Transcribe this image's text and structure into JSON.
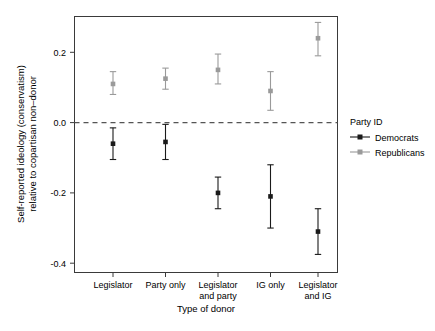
{
  "chart_data": {
    "type": "scatter",
    "title": "",
    "xlabel": "Type of donor",
    "ylabel": "Self-reported ideology (conservatism)\nrelative to copartisan non–donor",
    "ylabel_line1": "Self-reported ideology (conservatism)",
    "ylabel_line2": "relative to copartisan non–donor",
    "categories": [
      "Legislator",
      "Party only",
      "Legislator and party",
      "IG only",
      "Legislator and IG"
    ],
    "category_lines": [
      [
        "Legislator"
      ],
      [
        "Party only"
      ],
      [
        "Legislator",
        "and party"
      ],
      [
        "IG only"
      ],
      [
        "Legislator",
        "and IG"
      ]
    ],
    "ylim": [
      -0.45,
      0.31
    ],
    "yticks": [
      0.2,
      0.0,
      -0.2,
      -0.4
    ],
    "ytick_labels": [
      "0.2",
      "0.0",
      "-0.2",
      "-0.4"
    ],
    "grid": false,
    "reference_line": {
      "y": 0.0,
      "style": "dashed",
      "color": "#555555"
    },
    "legend": {
      "title": "Party ID",
      "position": "right",
      "entries": [
        {
          "label": "Democrats",
          "color": "#1a1a1a"
        },
        {
          "label": "Republicans",
          "color": "#9a9a9a"
        }
      ]
    },
    "series": [
      {
        "name": "Democrats",
        "color": "#1a1a1a",
        "values": [
          -0.06,
          -0.055,
          -0.2,
          -0.21,
          -0.31
        ],
        "ci_low": [
          -0.105,
          -0.105,
          -0.245,
          -0.3,
          -0.375
        ],
        "ci_high": [
          -0.015,
          -0.005,
          -0.155,
          -0.12,
          -0.245
        ]
      },
      {
        "name": "Republicans",
        "color": "#9a9a9a",
        "values": [
          0.11,
          0.125,
          0.15,
          0.09,
          0.24
        ],
        "ci_low": [
          0.08,
          0.095,
          0.11,
          0.035,
          0.19
        ],
        "ci_high": [
          0.145,
          0.155,
          0.195,
          0.145,
          0.285
        ]
      }
    ]
  },
  "panel": {
    "background": "#ffffff",
    "border_color": "#3a3a3a"
  }
}
